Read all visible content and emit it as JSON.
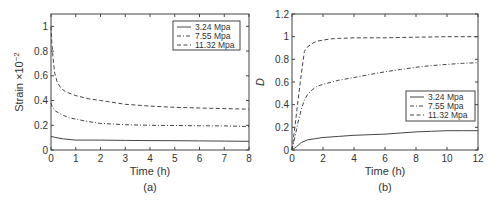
{
  "chart_data": [
    {
      "type": "line",
      "panel_label": "(a)",
      "xlabel": "Time (h)",
      "ylabel": "Strain ×10⁻²",
      "xlim": [
        0,
        8
      ],
      "ylim": [
        0,
        1.1
      ],
      "xticks": [
        0,
        1,
        2,
        3,
        4,
        5,
        6,
        7,
        8
      ],
      "yticks": [
        0,
        0.2,
        0.4,
        0.6,
        0.8,
        1
      ],
      "ytick_labels": [
        "0",
        "0.2",
        "0.4",
        "0.6",
        "0.8",
        "1"
      ],
      "grid": false,
      "legend_position": "upper right",
      "series": [
        {
          "name": "3.24 Mpa",
          "style": "solid",
          "x": [
            0,
            0.2,
            0.5,
            1,
            2,
            3,
            4,
            5,
            6,
            7,
            8
          ],
          "y": [
            0.11,
            0.1,
            0.09,
            0.08,
            0.08,
            0.078,
            0.076,
            0.075,
            0.074,
            0.072,
            0.07
          ]
        },
        {
          "name": "7.55 Mpa",
          "style": "dashdot",
          "x": [
            0,
            0.05,
            0.15,
            0.3,
            0.5,
            0.75,
            1,
            1.5,
            2,
            3,
            4,
            5,
            6,
            7,
            8
          ],
          "y": [
            0.38,
            0.35,
            0.32,
            0.3,
            0.28,
            0.26,
            0.25,
            0.23,
            0.215,
            0.205,
            0.2,
            0.198,
            0.196,
            0.195,
            0.19
          ]
        },
        {
          "name": "11.32 Mpa",
          "style": "dashed",
          "x": [
            0,
            0.03,
            0.08,
            0.15,
            0.25,
            0.4,
            0.6,
            1,
            1.5,
            2,
            3,
            4,
            5,
            6,
            7,
            8
          ],
          "y": [
            1.0,
            0.88,
            0.75,
            0.62,
            0.55,
            0.5,
            0.47,
            0.44,
            0.415,
            0.4,
            0.37,
            0.355,
            0.345,
            0.34,
            0.335,
            0.33
          ]
        }
      ]
    },
    {
      "type": "line",
      "panel_label": "(b)",
      "xlabel": "Time (h)",
      "ylabel": "D",
      "xlim": [
        0,
        12
      ],
      "ylim": [
        0,
        1.2
      ],
      "xticks": [
        0,
        2,
        4,
        6,
        8,
        10,
        12
      ],
      "yticks": [
        0,
        0.2,
        0.4,
        0.6,
        0.8,
        1,
        1.2
      ],
      "ytick_labels": [
        "0",
        "0.2",
        "0.4",
        "0.6",
        "0.8",
        "1",
        "1.2"
      ],
      "grid": false,
      "legend_position": "lower right",
      "series": [
        {
          "name": "3.24 Mpa",
          "style": "solid",
          "x": [
            0,
            0.3,
            0.6,
            1,
            1.5,
            2,
            3,
            4,
            5,
            6,
            7,
            8,
            9,
            10,
            11,
            12
          ],
          "y": [
            0,
            0.03,
            0.065,
            0.09,
            0.1,
            0.11,
            0.12,
            0.13,
            0.135,
            0.14,
            0.15,
            0.16,
            0.165,
            0.17,
            0.17,
            0.17
          ]
        },
        {
          "name": "7.55 Mpa",
          "style": "dashdot",
          "x": [
            0,
            0.2,
            0.4,
            0.6,
            0.8,
            1,
            1.3,
            1.6,
            2,
            3,
            4,
            5,
            6,
            7,
            8,
            9,
            10,
            11,
            12
          ],
          "y": [
            0,
            0.12,
            0.25,
            0.36,
            0.44,
            0.49,
            0.53,
            0.56,
            0.58,
            0.615,
            0.64,
            0.665,
            0.69,
            0.71,
            0.73,
            0.745,
            0.755,
            0.765,
            0.77
          ]
        },
        {
          "name": "11.32 Mpa",
          "style": "dashed",
          "x": [
            0,
            0.2,
            0.4,
            0.6,
            0.8,
            1,
            1.3,
            1.6,
            2,
            2.5,
            3,
            4,
            6,
            8,
            10,
            12
          ],
          "y": [
            0,
            0.22,
            0.45,
            0.67,
            0.87,
            0.91,
            0.94,
            0.96,
            0.97,
            0.98,
            0.985,
            0.99,
            0.99,
            0.995,
            1.0,
            1.0
          ]
        }
      ]
    }
  ],
  "panels": {
    "a": {
      "label": "(a)",
      "xlabel": "Time (h)",
      "ylabel": "Strain ×10⁻²"
    },
    "b": {
      "label": "(b)",
      "xlabel": "Time (h)",
      "ylabel": "D"
    }
  },
  "colors": {
    "axis": "#444444",
    "line": "#444444",
    "text": "#333333",
    "background": "#ffffff"
  }
}
